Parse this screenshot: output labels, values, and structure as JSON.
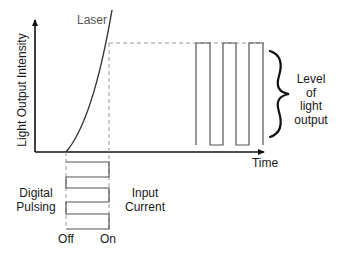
{
  "diagram": {
    "curve_label": "Laser",
    "y_axis_label": "Light Output Intensity",
    "x_axis_label": "Time",
    "output_label_lines": [
      "Level",
      "of",
      "light",
      "output"
    ],
    "input_left_label_lines": [
      "Digital",
      "Pulsing"
    ],
    "input_right_label_lines": [
      "Input",
      "Current"
    ],
    "input_axis_labels": {
      "off": "Off",
      "on": "On"
    },
    "colors": {
      "line": "#222222",
      "curve": "#333333",
      "dashed": "#999999",
      "pulse": "#555555",
      "text": "#1a1a1a",
      "curve_label": "#555555"
    }
  }
}
